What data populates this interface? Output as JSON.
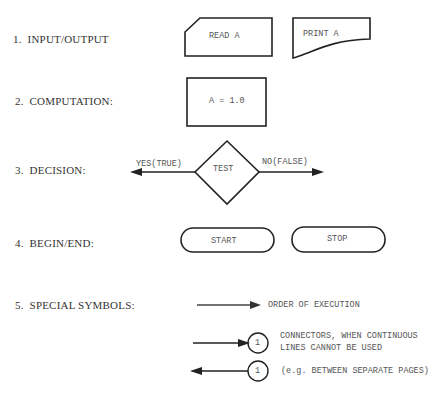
{
  "categories": [
    {
      "number": "1.",
      "label": "INPUT/OUTPUT"
    },
    {
      "number": "2.",
      "label": "COMPUTATION:"
    },
    {
      "number": "3.",
      "label": "DECISION:"
    },
    {
      "number": "4.",
      "label": "BEGIN/END:"
    },
    {
      "number": "5.",
      "label": "SPECIAL SYMBOLS:"
    }
  ],
  "symbols": {
    "read": "READ A",
    "print": "PRINT A",
    "computation": "A = 1.0",
    "decision": "TEST",
    "yes_label": "YES(TRUE)",
    "no_label": "NO(FALSE)",
    "start": "START",
    "stop": "STOP",
    "order": "ORDER OF EXECUTION",
    "connector_num_1": "1",
    "connector_num_2": "1",
    "connector_desc_1": "CONNECTORS, WHEN CONTINUOUS",
    "connector_desc_2": "LINES CANNOT BE USED",
    "connector_desc_3": "(e.g. BETWEEN SEPARATE PAGES)"
  },
  "colors": {
    "stroke": "#222222",
    "text": "#555555"
  }
}
